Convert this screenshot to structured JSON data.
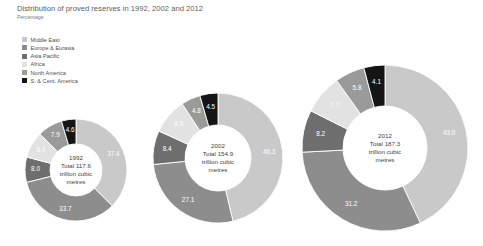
{
  "header": {
    "title": "Distribution of proved reserves in 1992, 2002 and 2012",
    "subtitle": "Percentage"
  },
  "legend": {
    "items": [
      {
        "label": "Middle East",
        "color": "#c9c9c9"
      },
      {
        "label": "Europe & Eurasia",
        "color": "#8d8d8d"
      },
      {
        "label": "Asia Pacific",
        "color": "#6e6e6e"
      },
      {
        "label": "Africa",
        "color": "#e2e2e2"
      },
      {
        "label": "North America",
        "color": "#9a9a9a"
      },
      {
        "label": "S. & Cent. America",
        "color": "#151515"
      }
    ]
  },
  "chart_data": {
    "type": "pie",
    "title": "Distribution of proved reserves in 1992, 2002 and 2012",
    "subtitle": "Percentage",
    "unit": "percent",
    "legend_position": "top-left",
    "categories": [
      "Middle East",
      "Europe & Eurasia",
      "Asia Pacific",
      "Africa",
      "North America",
      "S. & Cent. America"
    ],
    "colors": [
      "#c9c9c9",
      "#8d8d8d",
      "#6e6e6e",
      "#e2e2e2",
      "#9a9a9a",
      "#151515"
    ],
    "charts": [
      {
        "id": "chart-1992",
        "year": "1992",
        "center_lines": [
          "1992",
          "Total 117.6",
          "trillion cubic",
          "metres"
        ],
        "total": "117.6",
        "total_unit": "trillion cubic metres",
        "values": [
          37.4,
          33.7,
          8.0,
          8.4,
          7.9,
          4.6
        ],
        "labels": [
          "37.4",
          "33.7",
          "8.0",
          "8.4",
          "7.9",
          "4.6"
        ],
        "cx": 76,
        "cy": 170,
        "r_outer": 51,
        "r_inner": 26
      },
      {
        "id": "chart-2002",
        "year": "2002",
        "center_lines": [
          "2002",
          "Total 154.9",
          "trillion cubic",
          "metres"
        ],
        "total": "154.9",
        "total_unit": "trillion cubic metres",
        "values": [
          46.3,
          27.1,
          8.4,
          8.9,
          4.8,
          4.5
        ],
        "labels": [
          "46.3",
          "27.1",
          "8.4",
          "8.9",
          "4.8",
          "4.5"
        ],
        "cx": 218,
        "cy": 158,
        "r_outer": 65,
        "r_inner": 33
      },
      {
        "id": "chart-2012",
        "year": "2012",
        "center_lines": [
          "2012",
          "Total 187.3",
          "trillion cubic",
          "metres"
        ],
        "total": "187.3",
        "total_unit": "trillion cubic metres",
        "values": [
          43.0,
          31.2,
          8.2,
          7.7,
          5.8,
          4.1
        ],
        "labels": [
          "43.0",
          "31.2",
          "8.2",
          "7.7",
          "5.8",
          "4.1"
        ],
        "cx": 385,
        "cy": 148,
        "r_outer": 83,
        "r_inner": 42
      }
    ]
  }
}
